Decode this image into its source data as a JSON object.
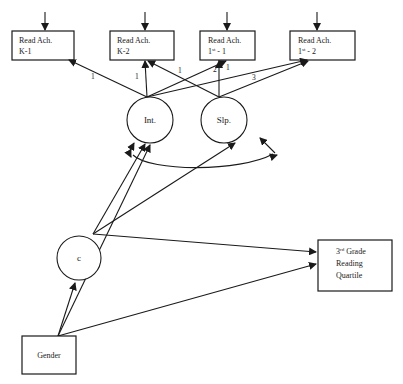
{
  "diagram": {
    "type": "path-diagram",
    "title": "",
    "observed_indicators": [
      {
        "id": "k1",
        "line1": "Read Ach.",
        "line2": "K-1",
        "sup": ""
      },
      {
        "id": "k2",
        "line1": "Read Ach.",
        "line2": "K-2",
        "sup": ""
      },
      {
        "id": "g1",
        "line1": "Read Ach.",
        "line2_pre": "1",
        "sup": "st",
        "line2_post": " - 1"
      },
      {
        "id": "g2",
        "line1": "Read Ach.",
        "line2_pre": "1",
        "sup": "st",
        "line2_post": " - 2"
      }
    ],
    "latent_growth_factors": [
      {
        "id": "int",
        "label": "Int."
      },
      {
        "id": "slp",
        "label": "Slp."
      }
    ],
    "latent_class": {
      "id": "c",
      "label": "c"
    },
    "outcome": {
      "id": "outcome",
      "line1_pre": "3",
      "sup": "rd",
      "line1_post": " Grade",
      "line2": "Reading",
      "line3": "Quartile"
    },
    "covariate": {
      "id": "gender",
      "label": "Gender"
    },
    "loadings": {
      "int_k1": "1",
      "int_k2": "1",
      "int_g1": "1",
      "slp_g1_a": "2",
      "slp_g1_b": "1",
      "slp_g2": "3"
    },
    "edges": [
      {
        "from": "int",
        "to": "k1",
        "label": "1"
      },
      {
        "from": "int",
        "to": "k2",
        "label": "1"
      },
      {
        "from": "int",
        "to": "g1",
        "label": "1"
      },
      {
        "from": "int",
        "to": "g2",
        "label": ""
      },
      {
        "from": "slp",
        "to": "k2",
        "label": ""
      },
      {
        "from": "slp",
        "to": "g1",
        "label": "2"
      },
      {
        "from": "slp",
        "to": "g2",
        "label": "3"
      },
      {
        "from": "c",
        "to": "int",
        "label": ""
      },
      {
        "from": "c",
        "to": "slp",
        "label": ""
      },
      {
        "from": "c",
        "to": "outcome",
        "label": ""
      },
      {
        "from": "gender",
        "to": "c",
        "label": ""
      },
      {
        "from": "gender",
        "to": "int",
        "label": ""
      },
      {
        "from": "gender",
        "to": "outcome",
        "label": ""
      },
      {
        "from": "int",
        "to": "slp",
        "label": "",
        "type": "covariance"
      }
    ],
    "residual_arrows": [
      "k1",
      "k2",
      "g1",
      "g2"
    ]
  }
}
